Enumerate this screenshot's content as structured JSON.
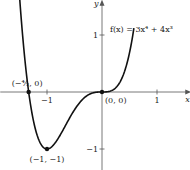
{
  "chart_data": {
    "type": "line",
    "title": "",
    "function_label": "f(x) = 3x⁴ + 4x³",
    "xlabel": "x",
    "ylabel": "y",
    "xlim": [
      -1.85,
      1.55
    ],
    "ylim": [
      -1.4,
      1.55
    ],
    "x_ticks": [
      {
        "value": -1,
        "label": "−1"
      },
      {
        "value": 1,
        "label": "1"
      }
    ],
    "y_ticks": [
      {
        "value": 1,
        "label": "1"
      },
      {
        "value": -1,
        "label": "−1"
      }
    ],
    "grid": false,
    "series": [
      {
        "name": "f(x) = 3x^4 + 4x^3",
        "expression": "3x^4 + 4x^3",
        "x_range": [
          -1.55,
          0.58
        ],
        "color": "#111111"
      }
    ],
    "points": [
      {
        "x": -1.3333,
        "y": 0,
        "label": "(−⁴⁄₃, 0)"
      },
      {
        "x": -1,
        "y": -1,
        "label": "(−1, −1)"
      },
      {
        "x": 0,
        "y": 0,
        "label": "(0, 0)"
      }
    ]
  }
}
